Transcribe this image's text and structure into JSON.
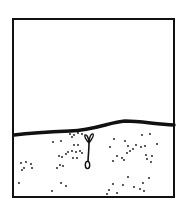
{
  "diagram": {
    "colors": {
      "background": "#ffffff",
      "ink": "#111111"
    },
    "frame": {
      "x": 13,
      "y": 19,
      "width": 161,
      "height": 178,
      "stroke_width": 2
    },
    "ground_line": {
      "path": "M14,135 C30,133 45,132 70,131 C95,130 110,122 125,121 C140,121 155,124 174,125",
      "stroke_width": 3.5
    },
    "seedling": {
      "stem_path": "M89,143 C89,150 88,158 88,162",
      "left_leaf_path": "M89,143 C86,140 84,136 85,135 C87,134 89,139 89,143",
      "right_leaf_path": "M89,143 C92,139 94,135 93,134 C91,133 89,138 89,143",
      "seed": {
        "cx": 87.5,
        "cy": 165,
        "rx": 2.2,
        "ry": 3.6
      }
    },
    "soil_specks": [
      [
        70,
        134
      ],
      [
        74,
        135
      ],
      [
        78,
        133
      ],
      [
        82,
        134
      ],
      [
        72,
        137
      ],
      [
        53,
        142
      ],
      [
        61,
        141
      ],
      [
        74,
        145
      ],
      [
        78,
        145
      ],
      [
        68,
        152
      ],
      [
        72,
        151
      ],
      [
        76,
        152
      ],
      [
        80,
        151
      ],
      [
        82,
        153
      ],
      [
        59,
        156
      ],
      [
        62,
        157
      ],
      [
        66,
        154
      ],
      [
        73,
        158
      ],
      [
        77,
        158
      ],
      [
        60,
        165
      ],
      [
        63,
        166
      ],
      [
        57,
        168
      ],
      [
        21,
        163
      ],
      [
        26,
        162
      ],
      [
        31,
        164
      ],
      [
        24,
        168
      ],
      [
        22,
        170
      ],
      [
        32,
        168
      ],
      [
        19,
        183
      ],
      [
        52,
        191
      ],
      [
        61,
        183
      ],
      [
        66,
        186
      ],
      [
        114,
        139
      ],
      [
        125,
        141
      ],
      [
        142,
        135
      ],
      [
        150,
        134
      ],
      [
        110,
        147
      ],
      [
        128,
        146
      ],
      [
        133,
        149
      ],
      [
        136,
        145
      ],
      [
        141,
        147
      ],
      [
        145,
        146
      ],
      [
        157,
        144
      ],
      [
        127,
        153
      ],
      [
        130,
        151
      ],
      [
        117,
        156
      ],
      [
        122,
        158
      ],
      [
        146,
        155
      ],
      [
        152,
        156
      ],
      [
        147,
        159
      ],
      [
        113,
        161
      ],
      [
        124,
        160
      ],
      [
        151,
        162
      ],
      [
        128,
        177
      ],
      [
        149,
        178
      ],
      [
        113,
        184
      ],
      [
        109,
        190
      ],
      [
        107,
        194
      ],
      [
        123,
        185
      ],
      [
        134,
        187
      ],
      [
        143,
        183
      ],
      [
        140,
        189
      ],
      [
        144,
        191
      ],
      [
        117,
        193
      ]
    ]
  }
}
